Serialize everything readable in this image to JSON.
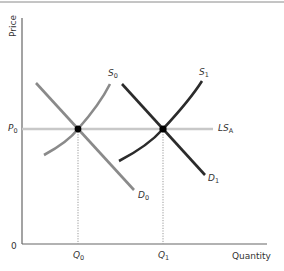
{
  "diagram": {
    "type": "supply-demand",
    "y_axis_label": "Price",
    "x_axis_label": "Quantity",
    "origin_label": "0",
    "price_level": {
      "main": "P",
      "sub": "0"
    },
    "quantities": [
      {
        "main": "Q",
        "sub": "0"
      },
      {
        "main": "Q",
        "sub": "1"
      }
    ],
    "curves": [
      {
        "id": "S0",
        "main": "S",
        "sub": "0",
        "kind": "supply",
        "color": "#8a8a8a"
      },
      {
        "id": "D0",
        "main": "D",
        "sub": "0",
        "kind": "demand",
        "color": "#8a8a8a"
      },
      {
        "id": "S1",
        "main": "S",
        "sub": "1",
        "kind": "supply",
        "color": "#2b2b2b"
      },
      {
        "id": "D1",
        "main": "D",
        "sub": "1",
        "kind": "demand",
        "color": "#2b2b2b"
      }
    ],
    "long_run_supply": {
      "main": "LS",
      "sub": "A",
      "color": "#c8c8c8"
    },
    "equilibria": [
      "(Q0, P0)",
      "(Q1, P0)"
    ]
  }
}
